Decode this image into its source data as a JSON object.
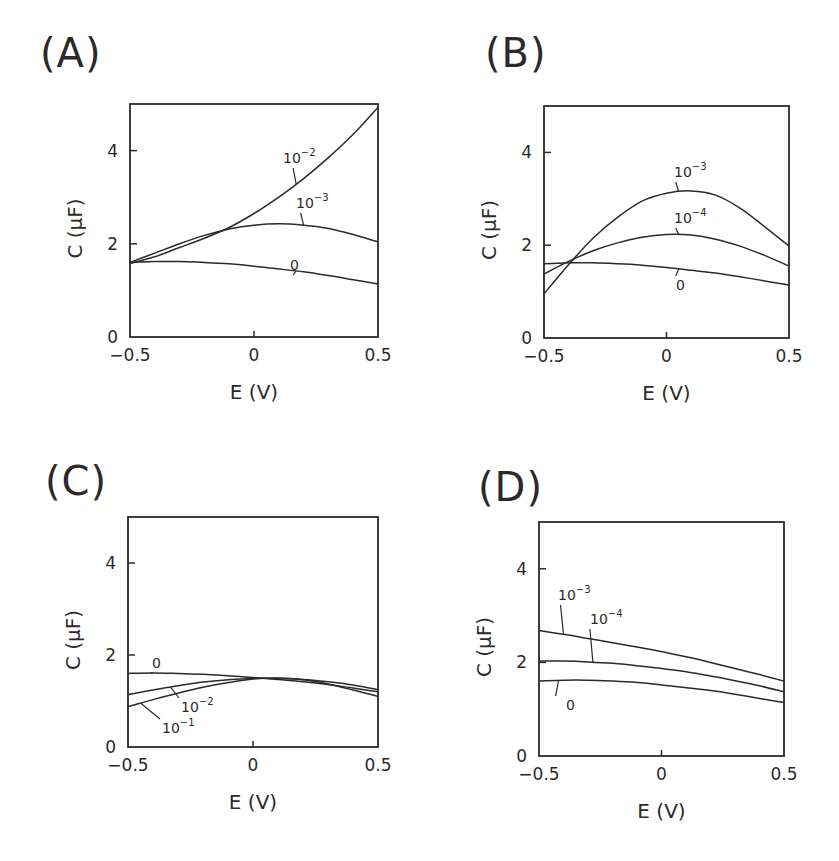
{
  "figure": {
    "panels": [
      {
        "id": "A",
        "label": "(A)"
      },
      {
        "id": "B",
        "label": "(B)"
      },
      {
        "id": "C",
        "label": "(C)"
      },
      {
        "id": "D",
        "label": "(D)"
      }
    ]
  },
  "chart_data": [
    {
      "type": "line",
      "title": "(A)",
      "xlabel": "E (V)",
      "ylabel": "C (μF)",
      "xlim": [
        -0.5,
        0.5
      ],
      "ylim": [
        0,
        5
      ],
      "xticks": [
        "-0.5",
        "0",
        "0.5"
      ],
      "yticks": [
        "0",
        "2",
        "4"
      ],
      "grid": false,
      "legend": "inline curve labels",
      "x": [
        -0.5,
        -0.4,
        -0.3,
        -0.2,
        -0.1,
        0.0,
        0.1,
        0.2,
        0.3,
        0.4,
        0.5
      ],
      "series": [
        {
          "name": "10^-2",
          "label_base": "10",
          "label_exp": "−2",
          "values": [
            1.58,
            1.72,
            1.92,
            2.12,
            2.35,
            2.65,
            3.0,
            3.4,
            3.85,
            4.35,
            4.93
          ]
        },
        {
          "name": "10^-3",
          "label_base": "10",
          "label_exp": "−3",
          "values": [
            1.6,
            1.8,
            2.0,
            2.18,
            2.32,
            2.4,
            2.43,
            2.4,
            2.33,
            2.2,
            2.04
          ]
        },
        {
          "name": "0",
          "label_base": "0",
          "label_exp": "",
          "values": [
            1.6,
            1.62,
            1.62,
            1.6,
            1.57,
            1.52,
            1.46,
            1.4,
            1.32,
            1.23,
            1.14
          ]
        }
      ]
    },
    {
      "type": "line",
      "title": "(B)",
      "xlabel": "E (V)",
      "ylabel": "C (μF)",
      "xlim": [
        -0.5,
        0.5
      ],
      "ylim": [
        0,
        5
      ],
      "xticks": [
        "-0.5",
        "0",
        "0.5"
      ],
      "yticks": [
        "0",
        "2",
        "4"
      ],
      "grid": false,
      "legend": "inline curve labels",
      "x": [
        -0.5,
        -0.4,
        -0.3,
        -0.2,
        -0.1,
        0.0,
        0.1,
        0.2,
        0.3,
        0.4,
        0.5
      ],
      "series": [
        {
          "name": "10^-3",
          "label_base": "10",
          "label_exp": "−3",
          "values": [
            0.95,
            1.58,
            2.15,
            2.6,
            2.95,
            3.12,
            3.17,
            3.08,
            2.8,
            2.4,
            1.98
          ]
        },
        {
          "name": "10^-4",
          "label_base": "10",
          "label_exp": "−4",
          "values": [
            1.38,
            1.65,
            1.88,
            2.05,
            2.17,
            2.23,
            2.22,
            2.13,
            1.98,
            1.78,
            1.55
          ]
        },
        {
          "name": "0",
          "label_base": "0",
          "label_exp": "",
          "values": [
            1.6,
            1.62,
            1.62,
            1.6,
            1.57,
            1.52,
            1.46,
            1.4,
            1.32,
            1.23,
            1.14
          ]
        }
      ]
    },
    {
      "type": "line",
      "title": "(C)",
      "xlabel": "E (V)",
      "ylabel": "C (μF)",
      "xlim": [
        -0.5,
        0.5
      ],
      "ylim": [
        0,
        5
      ],
      "xticks": [
        "-0.5",
        "0",
        "0.5"
      ],
      "yticks": [
        "0",
        "2",
        "4"
      ],
      "grid": false,
      "legend": "inline curve labels",
      "x": [
        -0.5,
        -0.4,
        -0.3,
        -0.2,
        -0.1,
        0.0,
        0.1,
        0.2,
        0.3,
        0.4,
        0.5
      ],
      "series": [
        {
          "name": "0",
          "label_base": "0",
          "label_exp": "",
          "values": [
            1.6,
            1.61,
            1.6,
            1.58,
            1.55,
            1.51,
            1.47,
            1.42,
            1.36,
            1.28,
            1.2
          ]
        },
        {
          "name": "10^-2",
          "label_base": "10",
          "label_exp": "−2",
          "values": [
            1.14,
            1.24,
            1.33,
            1.41,
            1.46,
            1.49,
            1.49,
            1.47,
            1.42,
            1.35,
            1.25
          ]
        },
        {
          "name": "10^-1",
          "label_base": "10",
          "label_exp": "−1",
          "values": [
            0.88,
            1.03,
            1.17,
            1.3,
            1.4,
            1.48,
            1.5,
            1.46,
            1.37,
            1.24,
            1.1
          ]
        }
      ]
    },
    {
      "type": "line",
      "title": "(D)",
      "xlabel": "E (V)",
      "ylabel": "C (μF)",
      "xlim": [
        -0.5,
        0.5
      ],
      "ylim": [
        0,
        5
      ],
      "xticks": [
        "-0.5",
        "0",
        "0.5"
      ],
      "yticks": [
        "0",
        "2",
        "4"
      ],
      "grid": false,
      "legend": "inline curve labels",
      "x": [
        -0.5,
        -0.4,
        -0.3,
        -0.2,
        -0.1,
        0.0,
        0.1,
        0.2,
        0.3,
        0.4,
        0.5
      ],
      "series": [
        {
          "name": "10^-3",
          "label_base": "10",
          "label_exp": "−3",
          "values": [
            2.68,
            2.6,
            2.51,
            2.42,
            2.33,
            2.23,
            2.12,
            2.0,
            1.87,
            1.74,
            1.6
          ]
        },
        {
          "name": "10^-4",
          "label_base": "10",
          "label_exp": "−4",
          "values": [
            2.03,
            2.03,
            2.01,
            1.98,
            1.93,
            1.87,
            1.8,
            1.71,
            1.61,
            1.5,
            1.37
          ]
        },
        {
          "name": "0",
          "label_base": "0",
          "label_exp": "",
          "values": [
            1.6,
            1.62,
            1.62,
            1.6,
            1.57,
            1.52,
            1.46,
            1.4,
            1.32,
            1.23,
            1.14
          ]
        }
      ]
    }
  ]
}
